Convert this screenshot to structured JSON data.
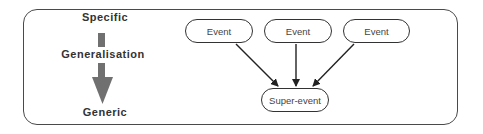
{
  "scale": {
    "top_label": "Specific",
    "middle_label": "Generalisation",
    "bottom_label": "Generic"
  },
  "events": [
    {
      "label": "Event"
    },
    {
      "label": "Event"
    },
    {
      "label": "Event"
    }
  ],
  "super_event": {
    "label": "Super-event"
  },
  "colors": {
    "arrow_fill": "#707070",
    "line": "#333333"
  }
}
